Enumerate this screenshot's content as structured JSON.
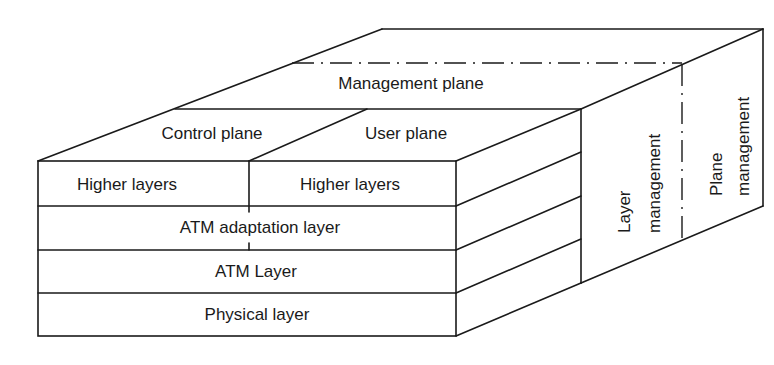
{
  "diagram": {
    "planes": {
      "management": "Management plane",
      "control": "Control plane",
      "user": "User plane"
    },
    "front_layers": {
      "higher_control": "Higher layers",
      "higher_user": "Higher layers",
      "aal": "ATM adaptation layer",
      "atm": "ATM Layer",
      "physical": "Physical layer"
    },
    "side_panels": {
      "layer_mgmt_line1": "Layer",
      "layer_mgmt_line2": "management",
      "plane_mgmt_line1": "Plane",
      "plane_mgmt_line2": "management"
    },
    "colors": {
      "line": "#1a1a1a",
      "background": "#ffffff"
    }
  }
}
